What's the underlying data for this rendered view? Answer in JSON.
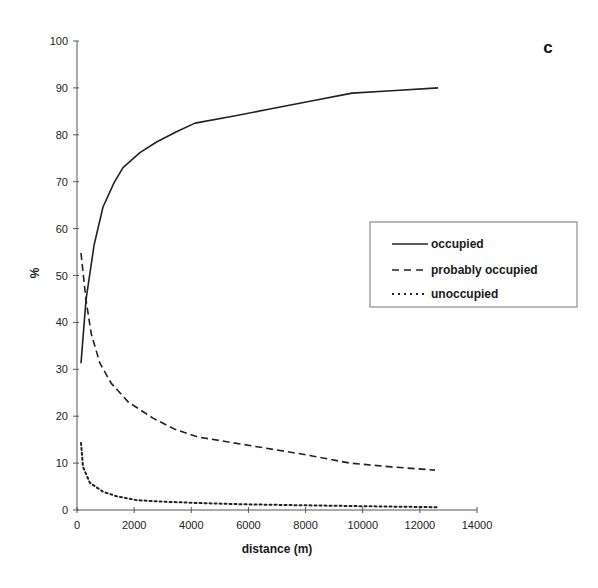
{
  "chart_data": {
    "type": "line",
    "title": "",
    "panel_label": "c",
    "xlabel": "distance (m)",
    "ylabel": "%",
    "xlim": [
      0,
      14000
    ],
    "ylim": [
      0,
      100
    ],
    "x_ticks": [
      0,
      2000,
      4000,
      6000,
      8000,
      10000,
      12000,
      14000
    ],
    "y_ticks": [
      0,
      10,
      20,
      30,
      40,
      50,
      60,
      70,
      80,
      90,
      100
    ],
    "grid": false,
    "legend_position": "right-middle",
    "series": [
      {
        "name": "occupied",
        "style": "solid",
        "x": [
          140,
          315,
          600,
          910,
          1300,
          1610,
          2200,
          2800,
          3500,
          4130,
          5500,
          6750,
          8200,
          9630,
          11000,
          12640
        ],
        "y": [
          31.3,
          44.8,
          56.5,
          64.6,
          69.8,
          73.0,
          76.2,
          78.5,
          80.7,
          82.5,
          84.0,
          85.5,
          87.2,
          88.9,
          89.4,
          90.0
        ]
      },
      {
        "name": "probably occupied",
        "style": "dashed",
        "x": [
          140,
          315,
          500,
          800,
          1200,
          1800,
          2660,
          3400,
          4200,
          6000,
          8000,
          9550,
          11000,
          12530
        ],
        "y": [
          54.8,
          44.8,
          37.5,
          31.3,
          27.0,
          23.0,
          19.6,
          17.3,
          15.6,
          13.8,
          11.8,
          10.0,
          9.2,
          8.5
        ]
      },
      {
        "name": "unoccupied",
        "style": "dotted",
        "x": [
          140,
          210,
          450,
          910,
          1400,
          2100,
          3000,
          4200,
          6000,
          8000,
          10000,
          12600
        ],
        "y": [
          14.3,
          9.2,
          5.8,
          3.9,
          2.9,
          2.1,
          1.8,
          1.5,
          1.2,
          1.0,
          0.8,
          0.6
        ]
      }
    ]
  },
  "colors": {
    "line": "#222222",
    "axis": "#555555",
    "legend_border": "#777777",
    "background": "#ffffff"
  }
}
